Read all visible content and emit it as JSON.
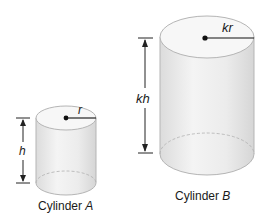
{
  "cylinders": [
    {
      "name": "Cylinder A",
      "caption_prefix": "Cylinder ",
      "caption_letter": "A",
      "radius_label": "r",
      "height_label": "h"
    },
    {
      "name": "Cylinder B",
      "caption_prefix": "Cylinder ",
      "caption_letter": "B",
      "radius_label": "kr",
      "height_label": "kh"
    }
  ],
  "colors": {
    "body_fill": "#ececec",
    "top_fill": "#f7f7f7",
    "outline": "#b5b5b5",
    "dimension": "#222222"
  }
}
